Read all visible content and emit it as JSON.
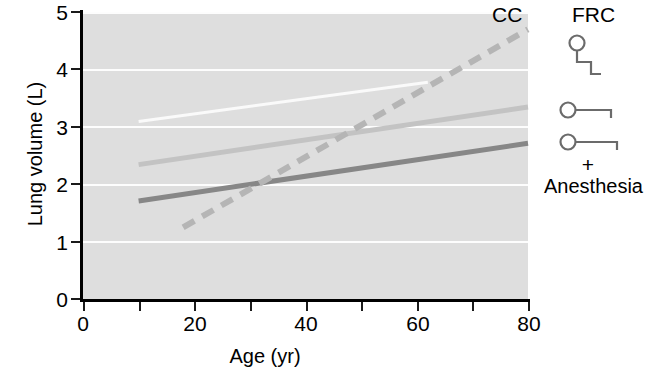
{
  "chart_data": {
    "type": "line",
    "title": "",
    "xlabel": "Age (yr)",
    "ylabel": "Lung volume (L)",
    "xlim": [
      0,
      80
    ],
    "ylim": [
      0,
      5
    ],
    "xticks": [
      0,
      20,
      40,
      60,
      80
    ],
    "xtick_labels": [
      "0",
      "20",
      "40",
      "60",
      "80"
    ],
    "xminor_ticks": [
      10,
      30,
      50,
      70
    ],
    "yticks": [
      0,
      1,
      2,
      3,
      4,
      5
    ],
    "ytick_labels": [
      "0",
      "1",
      "2",
      "3",
      "4",
      "5"
    ],
    "grid": "horizontal",
    "legend_position": "right",
    "background_color": "#dedede",
    "gridline_color": "#fdfdfd",
    "annotations": [
      {
        "text": "CC",
        "x": 76,
        "y": 4.85
      }
    ],
    "series": [
      {
        "name": "FRC upright",
        "style": "solid",
        "color": "#fafafa",
        "width": 3,
        "x": [
          10,
          62
        ],
        "y": [
          3.1,
          3.78
        ]
      },
      {
        "name": "FRC supine",
        "style": "solid",
        "color": "#c3c3c3",
        "width": 5,
        "x": [
          10,
          80
        ],
        "y": [
          2.35,
          3.35
        ]
      },
      {
        "name": "FRC supine + Anesthesia",
        "style": "solid",
        "color": "#878787",
        "width": 5,
        "x": [
          10,
          80
        ],
        "y": [
          1.72,
          2.72
        ]
      },
      {
        "name": "CC",
        "style": "dashed",
        "color": "#b5b5b5",
        "width": 6,
        "dash": "13 9",
        "x": [
          18,
          80
        ],
        "y": [
          1.26,
          4.7
        ]
      }
    ]
  },
  "legend": {
    "title": "FRC",
    "plus": "+",
    "bottom_label": "Anesthesia",
    "marker_color": "#6b6b6b",
    "items": [
      {
        "name": "frc-upright-marker",
        "shape": "circle-step-bracket"
      },
      {
        "name": "frc-supine-marker",
        "shape": "circle-line-tick"
      },
      {
        "name": "frc-anesthesia-marker",
        "shape": "circle-line-tick"
      }
    ]
  }
}
